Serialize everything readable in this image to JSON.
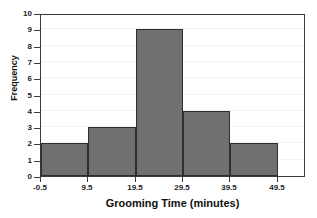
{
  "scan_header": {
    "text": "",
    "note": "illegible faint scan remnant"
  },
  "chart_data": {
    "type": "bar",
    "subtype": "histogram",
    "title": "",
    "xlabel": "Grooming Time (minutes)",
    "ylabel": "Frequency",
    "xlim": [
      -0.5,
      55.5
    ],
    "ylim": [
      0,
      10
    ],
    "grid": false,
    "legend": null,
    "bin_edges": [
      -0.5,
      9.5,
      19.5,
      29.5,
      39.5,
      49.5
    ],
    "categories": [
      "-0.5 to 9.5",
      "9.5 to 19.5",
      "19.5 to 29.5",
      "29.5 to 39.5",
      "39.5 to 49.5"
    ],
    "values": [
      2,
      3,
      9,
      4,
      2
    ],
    "bar_color": "#707070",
    "bar_edge_color": "#2e2e2e",
    "x_ticks": [
      "-0.5",
      "9.5",
      "19.5",
      "29.5",
      "39.5",
      "49.5"
    ],
    "x_tick_values": [
      -0.5,
      9.5,
      19.5,
      29.5,
      39.5,
      49.5
    ],
    "y_ticks": [
      "0",
      "1",
      "2",
      "3",
      "4",
      "5",
      "6",
      "7",
      "8",
      "9",
      "10"
    ],
    "y_tick_values": [
      0,
      1,
      2,
      3,
      4,
      5,
      6,
      7,
      8,
      9,
      10
    ],
    "total_count": 20
  }
}
